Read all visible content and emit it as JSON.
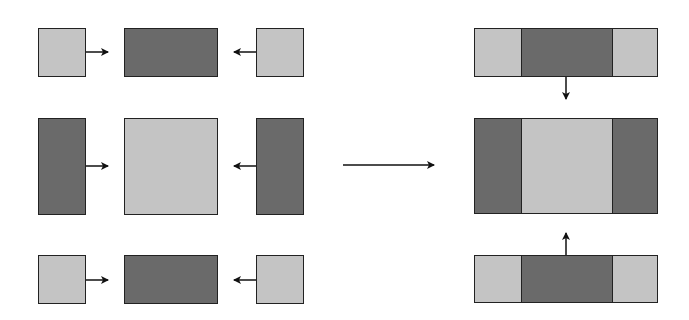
{
  "colors": {
    "light": "#c4c4c4",
    "dark": "#6a6a6a",
    "stroke": "#222222",
    "background": "#ffffff"
  },
  "left_group": {
    "rows": [
      {
        "name": "top-row",
        "left": "light",
        "center": "dark",
        "right": "light"
      },
      {
        "name": "middle-row",
        "left": "dark",
        "center": "light",
        "right": "dark"
      },
      {
        "name": "bottom-row",
        "left": "light",
        "center": "dark",
        "right": "light"
      }
    ]
  },
  "transition_arrow": {
    "direction": "right"
  },
  "right_group": {
    "bars": [
      {
        "name": "top-bar",
        "segments": [
          "light",
          "dark",
          "light"
        ],
        "arrow": "down"
      },
      {
        "name": "middle-bar",
        "segments": [
          "dark",
          "light",
          "dark"
        ]
      },
      {
        "name": "bottom-bar",
        "segments": [
          "light",
          "dark",
          "light"
        ],
        "arrow": "up"
      }
    ]
  }
}
